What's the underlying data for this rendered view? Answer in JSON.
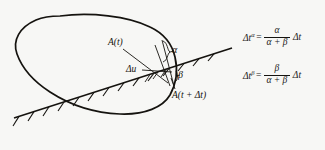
{
  "figure": {
    "name": "time-splitting-diagram",
    "background_color": "#f7f7f5",
    "ink_color": "#15130f",
    "labels": {
      "curve_point_start": "A(t)",
      "angle_upper": "α",
      "increment": "Δu",
      "angle_lower": "β",
      "curve_point_end": "A(t + Δt)"
    },
    "shapes": {
      "closed_curve": "blob-outline",
      "inclined_line": "hatched-boundary-line",
      "hatching_side": "below-line",
      "brace": "alpha-brace"
    }
  },
  "equations": [
    {
      "id": "delta-t-alpha",
      "lhs_base": "Δt",
      "lhs_sup": "α",
      "equals": "=",
      "numerator": "α",
      "denominator": "α + β",
      "tail": "Δt",
      "plain": "Δt^α = α/(α+β) Δt"
    },
    {
      "id": "delta-t-beta",
      "lhs_base": "Δt",
      "lhs_sup": "β",
      "equals": "=",
      "numerator": "β",
      "denominator": "α + β",
      "tail": "Δt",
      "plain": "Δt^β = β/(α+β) Δt"
    }
  ]
}
